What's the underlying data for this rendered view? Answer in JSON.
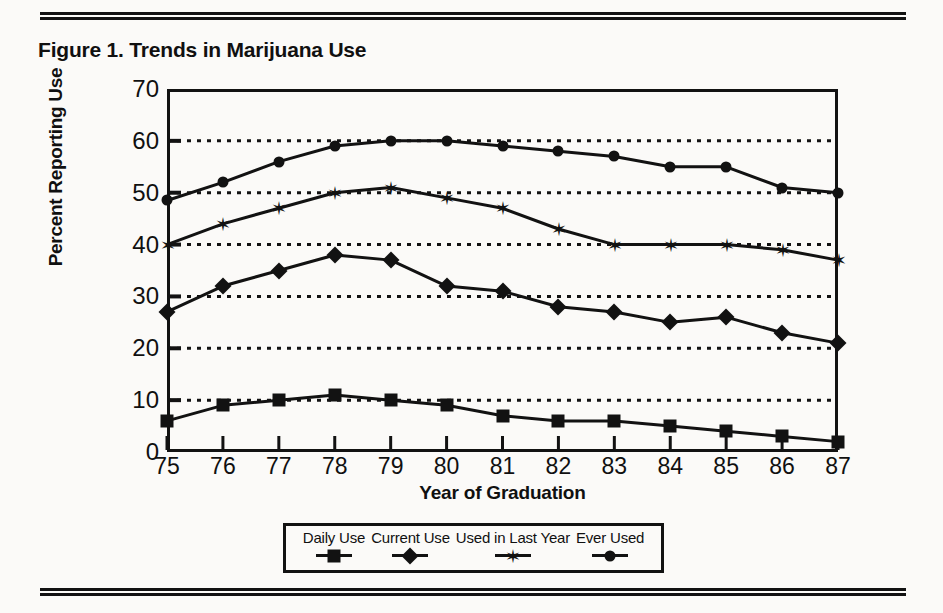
{
  "figure": {
    "title": "Figure 1. Trends in Marijuana Use"
  },
  "chart_data": {
    "type": "line",
    "title": "Figure 1. Trends in Marijuana Use",
    "xlabel": "Year of Graduation",
    "ylabel": "Percent Reporting Use",
    "xlim": [
      75,
      87
    ],
    "ylim": [
      0,
      70
    ],
    "ytick_step": 10,
    "grid": "horizontal-dotted",
    "legend_position": "below-center",
    "categories": [
      "75",
      "76",
      "77",
      "78",
      "79",
      "80",
      "81",
      "82",
      "83",
      "84",
      "85",
      "86",
      "87"
    ],
    "x": [
      75,
      76,
      77,
      78,
      79,
      80,
      81,
      82,
      83,
      84,
      85,
      86,
      87
    ],
    "yticks": [
      0,
      10,
      20,
      30,
      40,
      50,
      60,
      70
    ],
    "ytick_labels": [
      "0",
      "10",
      "20",
      "30",
      "40",
      "50",
      "60",
      "70"
    ],
    "xtick_labels": [
      "75",
      "76",
      "77",
      "78",
      "79",
      "80",
      "81",
      "82",
      "83",
      "84",
      "85",
      "86",
      "87"
    ],
    "series": [
      {
        "name": "Daily Use",
        "marker": "square",
        "values": [
          6,
          9,
          10,
          11,
          10,
          9,
          7,
          6,
          6,
          5,
          4,
          3,
          2
        ]
      },
      {
        "name": "Current Use",
        "marker": "diamond",
        "values": [
          27,
          32,
          35,
          38,
          37,
          32,
          31,
          28,
          27,
          25,
          26,
          23,
          21
        ]
      },
      {
        "name": "Used in Last Year",
        "marker": "star",
        "values": [
          40,
          44,
          47,
          50,
          51,
          49,
          47,
          43,
          40,
          40,
          40,
          39,
          37
        ]
      },
      {
        "name": "Ever Used",
        "marker": "circle",
        "values": [
          48.5,
          52,
          56,
          59,
          60,
          60,
          59,
          58,
          57,
          55,
          55,
          51,
          50
        ]
      }
    ],
    "colors": {
      "line": "#121212",
      "marker": "#121212",
      "grid": "#121212",
      "axis": "#121212",
      "background": "#fbfaf8"
    }
  }
}
